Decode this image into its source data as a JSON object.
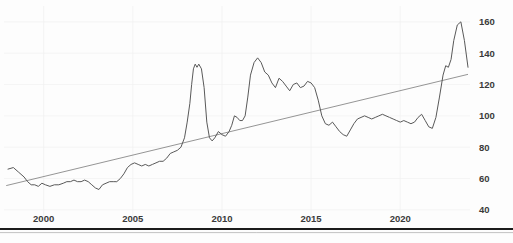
{
  "chart_data": {
    "type": "line",
    "title": "",
    "subtitle": "",
    "xlabel": "",
    "ylabel": "",
    "grid": true,
    "legend": null,
    "xlim": [
      1998.0,
      2023.8
    ],
    "ylim": [
      38,
      165
    ],
    "x_ticks": [
      2000,
      2005,
      2010,
      2015,
      2020
    ],
    "x_tick_labels": [
      "2000",
      "2005",
      "2010",
      "2015",
      "2020"
    ],
    "y_ticks": [
      40,
      60,
      80,
      100,
      120,
      140,
      160
    ],
    "y_tick_labels": [
      "40",
      "60",
      "80",
      "100",
      "120",
      "140",
      "160"
    ],
    "series": [
      {
        "name": "price-index",
        "color": "#595959",
        "x": [
          1998.0,
          1998.3,
          1998.6,
          1998.9,
          1999.1,
          1999.3,
          1999.5,
          1999.7,
          1999.9,
          2000.1,
          2000.35,
          2000.6,
          2000.85,
          2001.1,
          2001.3,
          2001.5,
          2001.7,
          2001.9,
          2002.1,
          2002.3,
          2002.5,
          2002.7,
          2002.9,
          2003.1,
          2003.3,
          2003.5,
          2003.7,
          2003.9,
          2004.1,
          2004.3,
          2004.5,
          2004.7,
          2004.9,
          2005.1,
          2005.3,
          2005.5,
          2005.7,
          2005.9,
          2006.1,
          2006.3,
          2006.5,
          2006.7,
          2006.9,
          2007.1,
          2007.3,
          2007.5,
          2007.7,
          2007.9,
          2008.05,
          2008.2,
          2008.3,
          2008.4,
          2008.5,
          2008.6,
          2008.7,
          2008.85,
          2009.0,
          2009.15,
          2009.3,
          2009.45,
          2009.6,
          2009.8,
          2010.0,
          2010.2,
          2010.4,
          2010.55,
          2010.7,
          2010.85,
          2011.0,
          2011.15,
          2011.3,
          2011.45,
          2011.6,
          2011.8,
          2012.0,
          2012.2,
          2012.4,
          2012.6,
          2012.8,
          2013.0,
          2013.2,
          2013.4,
          2013.6,
          2013.8,
          2014.0,
          2014.2,
          2014.4,
          2014.6,
          2014.8,
          2015.0,
          2015.2,
          2015.4,
          2015.6,
          2015.8,
          2016.0,
          2016.2,
          2016.4,
          2016.6,
          2016.8,
          2017.0,
          2017.2,
          2017.4,
          2017.6,
          2017.8,
          2018.0,
          2018.2,
          2018.4,
          2018.6,
          2018.8,
          2019.0,
          2019.2,
          2019.4,
          2019.6,
          2019.8,
          2020.0,
          2020.2,
          2020.4,
          2020.6,
          2020.8,
          2021.0,
          2021.2,
          2021.4,
          2021.6,
          2021.8,
          2022.0,
          2022.2,
          2022.4,
          2022.55,
          2022.7,
          2022.85,
          2023.0,
          2023.2,
          2023.4,
          2023.6,
          2023.8
        ],
        "y": [
          66,
          67,
          64,
          61,
          58,
          56,
          56,
          55,
          57,
          56,
          55,
          56,
          56,
          57,
          58,
          58,
          59,
          58,
          58,
          59,
          58,
          56,
          54,
          53,
          56,
          57,
          58,
          58,
          58,
          60,
          63,
          67,
          69,
          70,
          69,
          68,
          69,
          68,
          69,
          70,
          71,
          71,
          73,
          76,
          77,
          78,
          80,
          86,
          96,
          108,
          120,
          130,
          133,
          131,
          133,
          130,
          118,
          96,
          86,
          84,
          86,
          90,
          88,
          87,
          90,
          94,
          100,
          99,
          97,
          97,
          100,
          112,
          126,
          134,
          137,
          134,
          128,
          126,
          121,
          118,
          124,
          122,
          119,
          116,
          120,
          121,
          118,
          119,
          122,
          121,
          118,
          110,
          100,
          95,
          94,
          96,
          93,
          90,
          88,
          87,
          91,
          95,
          98,
          99,
          100,
          99,
          98,
          99,
          100,
          101,
          100,
          99,
          98,
          97,
          96,
          97,
          96,
          95,
          96,
          99,
          101,
          97,
          93,
          92,
          99,
          112,
          126,
          132,
          131,
          136,
          148,
          158,
          160,
          148,
          131
        ]
      }
    ],
    "trendline": {
      "name": "linear-trend",
      "color": "#7a7a7a",
      "x": [
        1997.9,
        2023.8
      ],
      "y": [
        55.5,
        126.5
      ]
    }
  }
}
